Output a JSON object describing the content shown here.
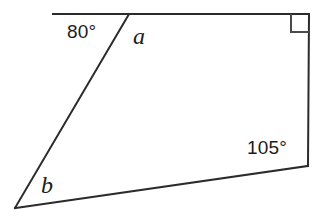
{
  "figure": {
    "kind": "geometry-diagram",
    "background_color": "#ffffff",
    "stroke_color": "#2b2b2b",
    "text_color": "#1c1c1c",
    "canvas": {
      "width": 328,
      "height": 218
    },
    "vertices": {
      "top_left_extension_end": {
        "x": 53,
        "y": 14
      },
      "top_vertex": {
        "x": 129,
        "y": 14
      },
      "top_right_vertex": {
        "x": 309,
        "y": 14
      },
      "bottom_right_vertex": {
        "x": 308,
        "y": 166
      },
      "bottom_left_vertex": {
        "x": 15,
        "y": 208
      }
    },
    "edges": [
      {
        "name": "top-extension-ray",
        "from": "top_left_extension_end",
        "to": "top_vertex"
      },
      {
        "name": "top-edge",
        "from": "top_vertex",
        "to": "top_right_vertex"
      },
      {
        "name": "right-edge",
        "from": "top_right_vertex",
        "to": "bottom_right_vertex"
      },
      {
        "name": "bottom-edge",
        "from": "bottom_right_vertex",
        "to": "bottom_left_vertex"
      },
      {
        "name": "left-edge",
        "from": "bottom_left_vertex",
        "to": "top_vertex"
      }
    ],
    "right_angle_marker": {
      "at": "top_right_vertex",
      "size": 18,
      "label": "right-angle-90"
    },
    "labels": {
      "angle_80": "80°",
      "angle_105": "105°",
      "angle_a": "a",
      "angle_b": "b"
    },
    "angle_values": {
      "angle_80_degrees": 80,
      "angle_105_degrees": 105,
      "right_angle_degrees": 90,
      "angle_a_unknown": "a",
      "angle_b_unknown": "b"
    }
  }
}
